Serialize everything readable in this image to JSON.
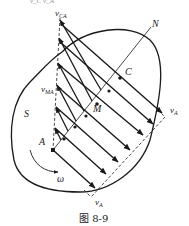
{
  "figure": {
    "caption": "图 8-9",
    "top_fragment": "v_C   v_A",
    "labels": {
      "body": "S",
      "point_a": "A",
      "point_m": "M",
      "point_c": "C",
      "axis_n": "N",
      "omega": "ω",
      "v_ca": {
        "main": "v",
        "sub": "CA"
      },
      "v_ma": {
        "main": "v",
        "sub": "MA"
      },
      "v_a_right": {
        "main": "v",
        "sub": "A"
      },
      "v_a_bottom": {
        "main": "v",
        "sub": "A"
      }
    },
    "colors": {
      "stroke": "#1a1a1a",
      "background": "#ffffff"
    }
  }
}
